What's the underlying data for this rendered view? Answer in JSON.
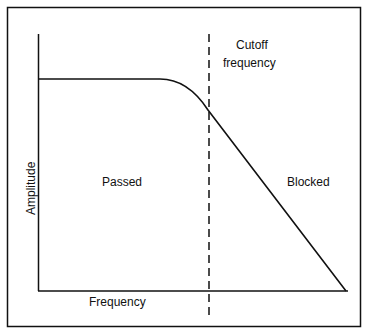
{
  "diagram": {
    "type": "low-pass filter frequency response",
    "x_axis_label": "Frequency",
    "y_axis_label": "Amplitude",
    "cutoff_label_line1": "Cutoff",
    "cutoff_label_line2": "frequency",
    "passband_label": "Passed",
    "stopband_label": "Blocked",
    "colors": {
      "line": "#111111",
      "background": "#ffffff"
    }
  }
}
